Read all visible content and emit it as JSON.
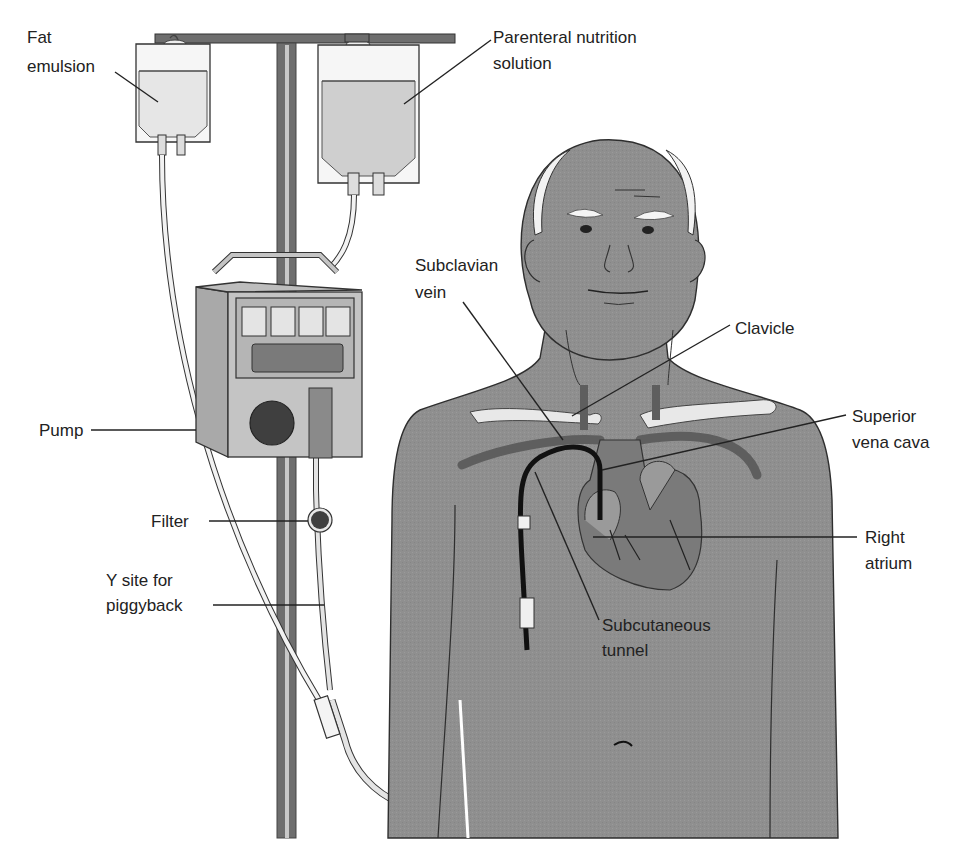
{
  "diagram": {
    "colors": {
      "skin": "#8f8f8f",
      "skin_outline": "#2e2e2e",
      "pole": "#6e6e6e",
      "pole_highlight": "#c8c8c8",
      "bag_fill_light": "#ececec",
      "bag_fill_pn": "#cfcfcf",
      "pump_body": "#c4c4c4",
      "pump_dark": "#5a5a5a",
      "vein": "#5e5e5e",
      "catheter": "#111111",
      "bone": "#e8e8e8",
      "heart": "#7a7a7a",
      "tubing": "#f2f2f2",
      "text": "#222222"
    },
    "labels": {
      "fat_emulsion": [
        "Fat",
        "emulsion"
      ],
      "pn_solution": [
        "Parenteral nutrition",
        "solution"
      ],
      "subclavian_vein": [
        "Subclavian",
        "vein"
      ],
      "clavicle": [
        "Clavicle"
      ],
      "superior_vena_cava": [
        "Superior",
        "vena cava"
      ],
      "pump": [
        "Pump"
      ],
      "filter": [
        "Filter"
      ],
      "y_site": [
        "Y site for",
        "piggyback"
      ],
      "right_atrium": [
        "Right",
        "atrium"
      ],
      "subcutaneous_tunnel": [
        "Subcutaneous",
        "tunnel"
      ]
    }
  }
}
